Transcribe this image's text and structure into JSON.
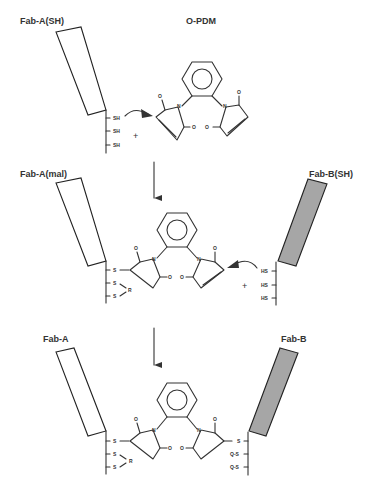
{
  "figure": {
    "colors": {
      "line": "#333333",
      "fab_a_fill": "#ffffff",
      "fab_b_fill": "#a6a6a6",
      "background": "#ffffff"
    }
  },
  "step1": {
    "fab_label": "Fab-A(SH)",
    "reagent_label": "O-PDM",
    "thiols": [
      "SH",
      "SH",
      "SH"
    ],
    "plus": "+",
    "o_labels": [
      "O",
      "O",
      "O",
      "O"
    ],
    "n_labels": [
      "N",
      "N"
    ]
  },
  "step2": {
    "fab_a_label": "Fab-A(mal)",
    "fab_b_label": "Fab-B(SH)",
    "fab_a_groups": [
      "S",
      "S",
      "S"
    ],
    "r_label": "R",
    "fab_b_thiols": [
      "HS",
      "HS",
      "HS"
    ],
    "plus": "+",
    "o_labels": [
      "O",
      "O",
      "O",
      "O"
    ],
    "n_labels": [
      "N",
      "N"
    ]
  },
  "step3": {
    "fab_a_label": "Fab-A",
    "fab_b_label": "Fab-B",
    "fab_a_groups": [
      "S",
      "S",
      "S"
    ],
    "r_label": "R",
    "fab_b_groups": [
      "S",
      "Q-S",
      "Q-S"
    ],
    "o_labels": [
      "O",
      "O",
      "O",
      "O"
    ],
    "n_labels": [
      "N",
      "N"
    ]
  },
  "arrows": [
    {
      "name": "step1-to-step2",
      "direction": "down"
    },
    {
      "name": "step2-to-step3",
      "direction": "down"
    }
  ]
}
